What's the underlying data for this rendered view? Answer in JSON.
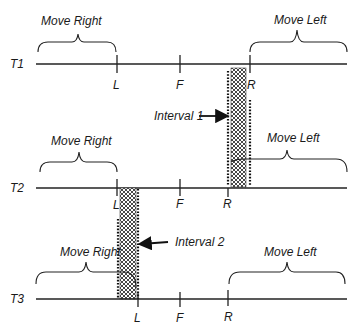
{
  "diagram": {
    "rows": [
      {
        "label": "T1",
        "tick_labels": {
          "L": "L",
          "F": "F",
          "R": "R"
        },
        "move_right": "Move Right",
        "move_left": "Move Left"
      },
      {
        "label": "T2",
        "tick_labels": {
          "L": "L",
          "F": "F",
          "R": "R"
        },
        "move_right": "Move Right",
        "move_left": "Move Left"
      },
      {
        "label": "T3",
        "tick_labels": {
          "L": "L",
          "F": "F",
          "R": "R"
        },
        "move_right": "Move Right",
        "move_left": "Move Left"
      }
    ],
    "intervals": [
      {
        "label": "Interval 1"
      },
      {
        "label": "Interval 2"
      }
    ]
  }
}
